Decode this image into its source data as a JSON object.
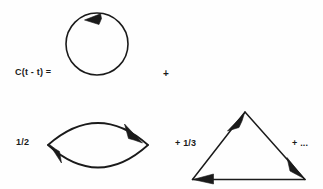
{
  "figure": {
    "type": "feynman-style-diagram",
    "stroke_color": "#1a1a1a",
    "background_color": "#fefefe"
  },
  "labels": {
    "lhs": "C(t - t) =",
    "plus_1": "+",
    "coefficient_half": "1/2",
    "coefficient_third": "+ 1/3",
    "ellipsis": "+ ..."
  },
  "diagrams": [
    {
      "name": "one-loop-circle",
      "shape": "circle",
      "center": [
        97,
        44
      ],
      "radius": 31,
      "arrow_count": 1,
      "arrow_direction": "counterclockwise",
      "arrow_position": "top"
    },
    {
      "name": "two-loop-lens",
      "shape": "lens",
      "left_vertex": [
        48,
        145
      ],
      "right_vertex": [
        148,
        145
      ],
      "top_apex": [
        98,
        113
      ],
      "bottom_apex": [
        98,
        177
      ],
      "arrow_count": 2,
      "arrow_direction": "clockwise",
      "arrow_positions": [
        "upper-right",
        "lower-left"
      ]
    },
    {
      "name": "three-loop-triangle",
      "shape": "triangle",
      "apex": [
        245,
        112
      ],
      "bottom_left": [
        192,
        180
      ],
      "bottom_right": [
        305,
        180
      ],
      "arrow_count": 3,
      "arrow_direction": "counterclockwise",
      "arrow_positions": [
        "left-edge-to-apex",
        "right-edge-to-bottom-right",
        "bottom-edge-to-bottom-left"
      ]
    }
  ]
}
